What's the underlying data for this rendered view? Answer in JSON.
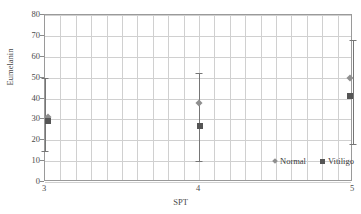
{
  "chart_data": {
    "type": "scatter",
    "title": "",
    "xlabel": "SPT",
    "ylabel": "Eumelanin",
    "x": [
      3,
      4,
      5
    ],
    "xticklabels": [
      "3",
      "4",
      "5"
    ],
    "xlim": [
      3,
      5
    ],
    "ylim": [
      0,
      80
    ],
    "yticks": [
      0,
      10,
      20,
      30,
      40,
      50,
      60,
      70,
      80
    ],
    "yticklabels": [
      "0",
      "10",
      "20",
      "30",
      "40",
      "50",
      "60",
      "70",
      "80"
    ],
    "grid": true,
    "legend_position": "lower-right-inside",
    "series": [
      {
        "name": "Normal",
        "marker": "diamond",
        "color": "#8f8f8f",
        "values": [
          31,
          38,
          50
        ],
        "err_low": [
          15,
          10,
          18
        ],
        "err_high": [
          50,
          52,
          68
        ]
      },
      {
        "name": "Vitiligo",
        "marker": "square",
        "color": "#555555",
        "values": [
          29,
          27,
          41
        ],
        "err_low": [
          15,
          10,
          18
        ],
        "err_high": [
          50,
          52,
          68
        ]
      }
    ]
  },
  "legend": {
    "normal_label": "Normal",
    "vitiligo_label": "Vitiligo"
  },
  "axes": {
    "x_title": "SPT",
    "y_title": "Eumelanin"
  }
}
